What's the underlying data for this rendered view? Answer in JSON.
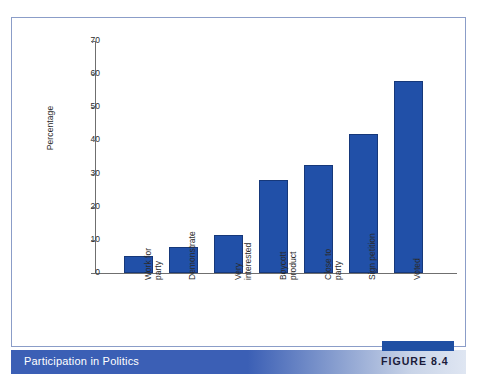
{
  "figure": {
    "caption": "Participation in Politics",
    "number_label": "FIGURE 8.4"
  },
  "colors": {
    "bar_fill": "#2150a8",
    "bar_stroke": "#16387a",
    "caption_band": "#3b5fb5",
    "panel_border": "#8b9dc8",
    "axis": "#6f6f6f",
    "figure_tab": "#1f4fa3"
  },
  "chart_data": {
    "type": "bar",
    "title": "Participation in Politics",
    "xlabel": "",
    "ylabel": "Percentage",
    "ylim": [
      0,
      70
    ],
    "yticks": [
      0,
      10,
      20,
      30,
      40,
      50,
      60,
      70
    ],
    "ytick_labels": [
      "0",
      "10",
      "20",
      "30",
      "40",
      "50",
      "60",
      "70"
    ],
    "grid": false,
    "legend": false,
    "categories": [
      "Work for party",
      "Demonstrate",
      "Very interested",
      "Boycott product",
      "Close to party",
      "Sign petition",
      "Voted"
    ],
    "category_lines": [
      [
        "Work for",
        "party"
      ],
      [
        "Demonstrate"
      ],
      [
        "Very",
        "interested"
      ],
      [
        "Boycott",
        "product"
      ],
      [
        "Close to",
        "party"
      ],
      [
        "Sign petition"
      ],
      [
        "Voted"
      ]
    ],
    "values": [
      5,
      8,
      11.5,
      28,
      32.5,
      42,
      58
    ]
  }
}
